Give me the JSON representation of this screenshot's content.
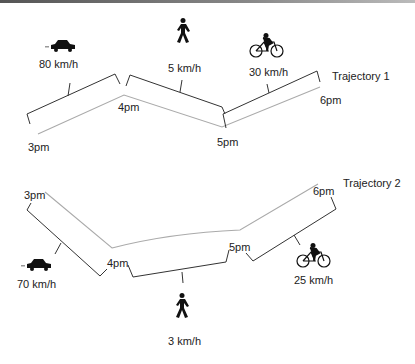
{
  "trajectory1": {
    "title": "Trajectory 1",
    "times": [
      "3pm",
      "4pm",
      "5pm",
      "6pm"
    ],
    "segments": [
      {
        "mode": "car",
        "icon": "car-icon",
        "speed": "80 km/h"
      },
      {
        "mode": "walk",
        "icon": "pedestrian-icon",
        "speed": "5 km/h"
      },
      {
        "mode": "bike",
        "icon": "bicycle-icon",
        "speed": "30 km/h"
      }
    ]
  },
  "trajectory2": {
    "title": "Trajectory 2",
    "times": [
      "3pm",
      "4pm",
      "5pm",
      "6pm"
    ],
    "segments": [
      {
        "mode": "car",
        "icon": "car-icon",
        "speed": "70 km/h"
      },
      {
        "mode": "walk",
        "icon": "pedestrian-icon",
        "speed": "3 km/h"
      },
      {
        "mode": "bike",
        "icon": "bicycle-icon",
        "speed": "25 km/h"
      }
    ]
  },
  "colors": {
    "path": "#aaaaaa",
    "bracket": "#333333",
    "icon": "#111111"
  }
}
